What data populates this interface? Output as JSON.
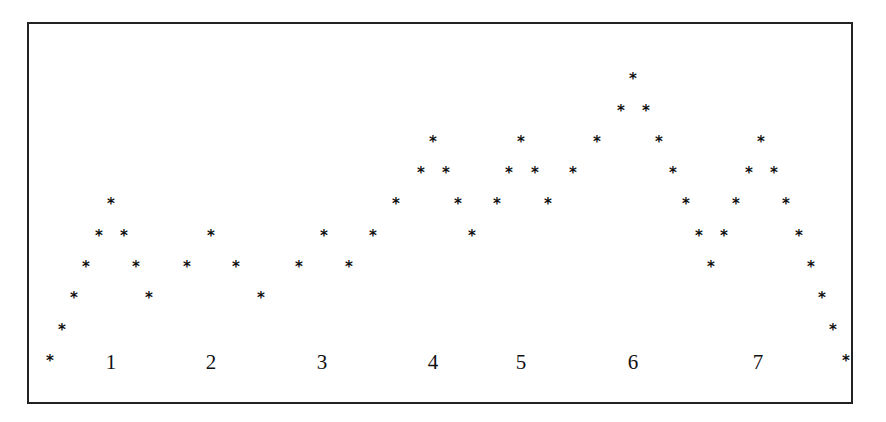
{
  "diagram": {
    "symbol": "*",
    "levels_y": [
      358,
      327,
      295,
      264,
      233,
      201,
      170,
      139,
      108,
      76
    ],
    "points": [
      {
        "x": 50,
        "level": 0
      },
      {
        "x": 62,
        "level": 1
      },
      {
        "x": 74,
        "level": 2
      },
      {
        "x": 86,
        "level": 3
      },
      {
        "x": 99,
        "level": 4
      },
      {
        "x": 111,
        "level": 5
      },
      {
        "x": 124,
        "level": 4
      },
      {
        "x": 136,
        "level": 3
      },
      {
        "x": 149,
        "level": 2
      },
      {
        "x": 187,
        "level": 3
      },
      {
        "x": 211,
        "level": 4
      },
      {
        "x": 236,
        "level": 3
      },
      {
        "x": 261,
        "level": 2
      },
      {
        "x": 299,
        "level": 3
      },
      {
        "x": 324,
        "level": 4
      },
      {
        "x": 349,
        "level": 3
      },
      {
        "x": 373,
        "level": 4
      },
      {
        "x": 396,
        "level": 5
      },
      {
        "x": 421,
        "level": 6
      },
      {
        "x": 433,
        "level": 7
      },
      {
        "x": 446,
        "level": 6
      },
      {
        "x": 458,
        "level": 5
      },
      {
        "x": 472,
        "level": 4
      },
      {
        "x": 497,
        "level": 5
      },
      {
        "x": 509,
        "level": 6
      },
      {
        "x": 521,
        "level": 7
      },
      {
        "x": 535,
        "level": 6
      },
      {
        "x": 548,
        "level": 5
      },
      {
        "x": 573,
        "level": 6
      },
      {
        "x": 597,
        "level": 7
      },
      {
        "x": 621,
        "level": 8
      },
      {
        "x": 633,
        "level": 9
      },
      {
        "x": 646,
        "level": 8
      },
      {
        "x": 659,
        "level": 7
      },
      {
        "x": 673,
        "level": 6
      },
      {
        "x": 686,
        "level": 5
      },
      {
        "x": 699,
        "level": 4
      },
      {
        "x": 711,
        "level": 3
      },
      {
        "x": 724,
        "level": 4
      },
      {
        "x": 736,
        "level": 5
      },
      {
        "x": 749,
        "level": 6
      },
      {
        "x": 761,
        "level": 7
      },
      {
        "x": 774,
        "level": 6
      },
      {
        "x": 786,
        "level": 5
      },
      {
        "x": 799,
        "level": 4
      },
      {
        "x": 811,
        "level": 3
      },
      {
        "x": 822,
        "level": 2
      },
      {
        "x": 833,
        "level": 1
      },
      {
        "x": 846,
        "level": 0
      }
    ],
    "labels": [
      {
        "text": "1",
        "x": 111
      },
      {
        "text": "2",
        "x": 211
      },
      {
        "text": "3",
        "x": 322
      },
      {
        "text": "4",
        "x": 433
      },
      {
        "text": "5",
        "x": 521
      },
      {
        "text": "6",
        "x": 633
      },
      {
        "text": "7",
        "x": 758
      }
    ],
    "labels_y": 362
  }
}
